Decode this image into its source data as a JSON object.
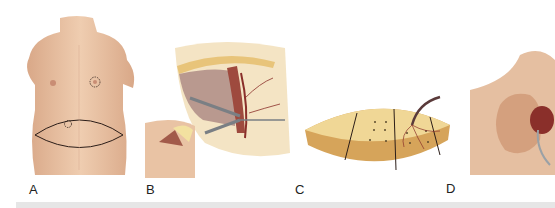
{
  "figure": {
    "panels": [
      {
        "id": "A",
        "label": "A",
        "description": "Female torso front view with elliptical lower abdominal skin-flap outline and periumbilical marking; circular marking around left nipple-areola"
      },
      {
        "id": "B",
        "label": "B",
        "description": "Surgical dissection showing flap with vascular pedicle and retractors; inset of lower torso with incision"
      },
      {
        "id": "C",
        "label": "C",
        "description": "Elliptical fat/skin flap divided into zones by lines, with perforator dots and a vascular pedicle"
      },
      {
        "id": "D",
        "label": "D",
        "description": "Close-up of reconstructed breast region with exposed vessels and instrument"
      }
    ]
  },
  "colors": {
    "skin": "#e9c3a4",
    "skin_shadow": "#d4a07e",
    "fat": "#f0d796",
    "fat_edge": "#c9923f",
    "vessel": "#8a2f2a",
    "outline": "#2b1d18",
    "band": "#e6e6e6"
  }
}
